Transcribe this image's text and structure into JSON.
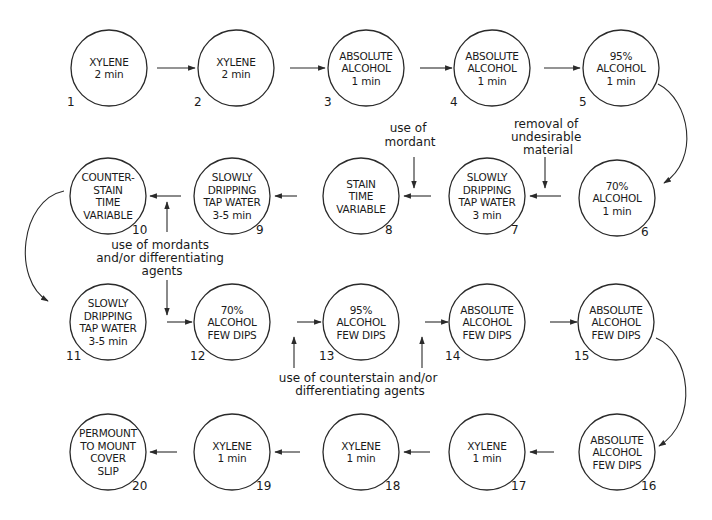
{
  "diagram": {
    "type": "staining-procedure-flowchart",
    "steps": [
      {
        "num": "1",
        "lines": [
          "XYLENE",
          "2 min"
        ],
        "cx": 109,
        "cy": 68
      },
      {
        "num": "2",
        "lines": [
          "XYLENE",
          "2 min"
        ],
        "cx": 236,
        "cy": 68
      },
      {
        "num": "3",
        "lines": [
          "ABSOLUTE",
          "ALCOHOL",
          "1 min"
        ],
        "cx": 366,
        "cy": 68
      },
      {
        "num": "4",
        "lines": [
          "ABSOLUTE",
          "ALCOHOL",
          "1 min"
        ],
        "cx": 492,
        "cy": 68
      },
      {
        "num": "5",
        "lines": [
          "95%",
          "ALCOHOL",
          "1 min"
        ],
        "cx": 621,
        "cy": 68
      },
      {
        "num": "6",
        "lines": [
          "70%",
          "ALCOHOL",
          "1 min"
        ],
        "cx": 617,
        "cy": 198
      },
      {
        "num": "7",
        "lines": [
          "SLOWLY",
          "DRIPPING",
          "TAP WATER",
          "3 min"
        ],
        "cx": 487,
        "cy": 196
      },
      {
        "num": "8",
        "lines": [
          "STAIN",
          "TIME",
          "VARIABLE"
        ],
        "cx": 361,
        "cy": 196
      },
      {
        "num": "9",
        "lines": [
          "SLOWLY",
          "DRIPPING",
          "TAP WATER",
          "3-5 min"
        ],
        "cx": 232,
        "cy": 196
      },
      {
        "num": "10",
        "lines": [
          "COUNTER-",
          "STAIN",
          "TIME",
          "VARIABLE"
        ],
        "cx": 108,
        "cy": 196
      },
      {
        "num": "11",
        "lines": [
          "SLOWLY",
          "DRIPPING",
          "TAP WATER",
          "3-5 min"
        ],
        "cx": 108,
        "cy": 322
      },
      {
        "num": "12",
        "lines": [
          "70%",
          "ALCOHOL",
          "FEW DIPS"
        ],
        "cx": 232,
        "cy": 322
      },
      {
        "num": "13",
        "lines": [
          "95%",
          "ALCOHOL",
          "FEW DIPS"
        ],
        "cx": 361,
        "cy": 322
      },
      {
        "num": "14",
        "lines": [
          "ABSOLUTE",
          "ALCOHOL",
          "FEW DIPS"
        ],
        "cx": 487,
        "cy": 322
      },
      {
        "num": "15",
        "lines": [
          "ABSOLUTE",
          "ALCOHOL",
          "FEW DIPS"
        ],
        "cx": 616,
        "cy": 322
      },
      {
        "num": "16",
        "lines": [
          "ABSOLUTE",
          "ALCOHOL",
          "FEW DIPS"
        ],
        "cx": 617,
        "cy": 452
      },
      {
        "num": "17",
        "lines": [
          "XYLENE",
          "1 min"
        ],
        "cx": 487,
        "cy": 452
      },
      {
        "num": "18",
        "lines": [
          "XYLENE",
          "1 min"
        ],
        "cx": 361,
        "cy": 452
      },
      {
        "num": "19",
        "lines": [
          "XYLENE",
          "1 min"
        ],
        "cx": 232,
        "cy": 452
      },
      {
        "num": "20",
        "lines": [
          "PERMOUNT",
          "TO MOUNT",
          "COVER",
          "SLIP"
        ],
        "cx": 108,
        "cy": 452
      }
    ],
    "annotations": {
      "mordant": [
        "use of",
        "mordant"
      ],
      "removal": [
        "removal of",
        "undesirable",
        "material"
      ],
      "mordants_differentiating": [
        "use of mordants",
        "and/or differentiating",
        "agents"
      ],
      "counterstain_differentiating": [
        "use of counterstain and/or",
        "differentiating agents"
      ]
    },
    "colors": {
      "line": "#2a2a2a",
      "text": "#1a1a1a",
      "background": "#ffffff"
    }
  }
}
